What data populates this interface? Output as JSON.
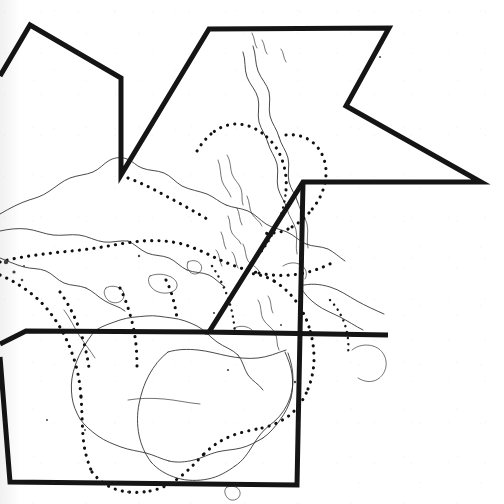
{
  "document": {
    "title": "Scanned map page with hand-drawn polygon overlay",
    "kind": "scanned-map-figure",
    "background_color": "#ffffff",
    "ink_color": "#151515",
    "coastline_color": "#2a2a2a",
    "dotted_boundary_color": "#111111",
    "width": 504,
    "height": 504,
    "visible_text": ""
  },
  "map": {
    "description": "Photocopied outline map of the Asia-Pacific / Southeast Asia region showing coastlines in thin line and maritime or biogeographic boundary lines rendered as dotted curves. Australia appears at lower centre, the Indonesian archipelago and Philippines at centre, mainland Asia at left, Japan and the Korean peninsula at upper left-centre, and New Guinea toward the right.",
    "linework": {
      "coastline_style": "thin-solid",
      "boundary_style": "dotted",
      "has_labels": false,
      "has_graticule": false,
      "has_scale_bar": false,
      "has_north_arrow": false
    }
  },
  "overlay": {
    "name": "polygon-annotation",
    "style": "thick-solid-black",
    "stroke_width": 5,
    "closed": false,
    "description": "A heavy black zig-zag / star-like polyline drawn over the map, forming two upward peaks at the top, a deep notch on the right, a long horizontal bar across the middle-right, and two descending triangular wedges toward the bottom.",
    "segments": [
      {
        "name": "upper-left-peak",
        "points": "0,76 30,25 121,78 121,175"
      },
      {
        "name": "upper-right-peak-and-notch",
        "points": "121,175 209,29 389,28 346,106 481,182 303,182 209,332 388,335"
      },
      {
        "name": "mid-left-wedge",
        "points": "0,345 25,331 209,332"
      },
      {
        "name": "lower-wedge",
        "points": "0,356 10,482 297,485 303,182"
      }
    ]
  },
  "render_paths": {
    "overlay_main": "M 0,76 L 30,25 L 121,78 L 121,175 L 209,29 L 389,28 L 346,106 L 481,182 L 303,182 L 209,332 L 388,335",
    "overlay_left_wedge": "M 0,344 L 26,331 L 209,332",
    "overlay_bottom": "M 0,357 L 10,482 L 297,485 L 303,182"
  }
}
